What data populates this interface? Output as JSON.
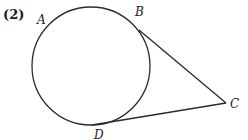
{
  "problem_number": "(2)",
  "figure": {
    "points": {
      "A": "A",
      "B": "B",
      "C": "C",
      "D": "D"
    },
    "colors": {
      "line": "#2a2a2a",
      "text": "#1a1a1a",
      "background": "#ffffff"
    }
  }
}
